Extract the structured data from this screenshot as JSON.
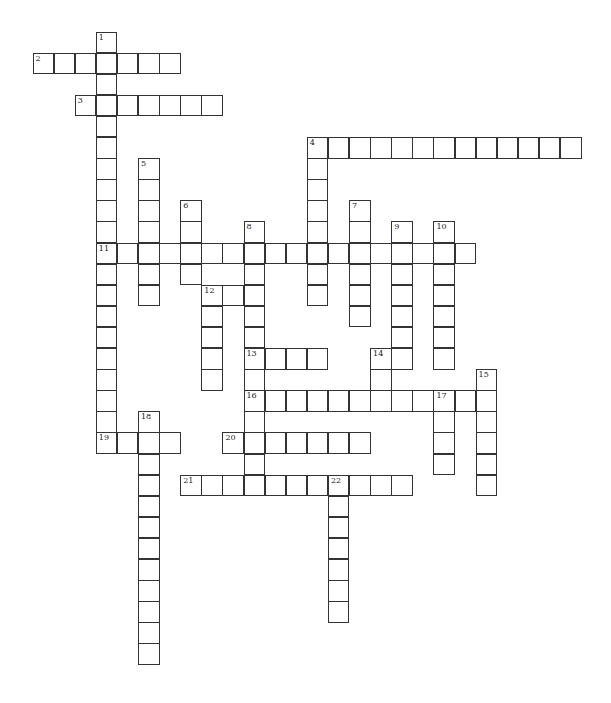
{
  "puzzle": {
    "title": "Crossword",
    "cell_size": 21.1,
    "origin_x": 33,
    "origin_y": 32,
    "entries": [
      {
        "number": "1",
        "direction": "down",
        "row": 0,
        "col": 3,
        "length": 20
      },
      {
        "number": "2",
        "direction": "across",
        "row": 1,
        "col": 0,
        "length": 7
      },
      {
        "number": "3",
        "direction": "across",
        "row": 3,
        "col": 2,
        "length": 7
      },
      {
        "number": "4",
        "direction": "across",
        "row": 5,
        "col": 13,
        "length": 13
      },
      {
        "number": "4",
        "direction": "down",
        "row": 5,
        "col": 13,
        "length": 8
      },
      {
        "number": "5",
        "direction": "down",
        "row": 6,
        "col": 5,
        "length": 7
      },
      {
        "number": "6",
        "direction": "down",
        "row": 8,
        "col": 7,
        "length": 4
      },
      {
        "number": "7",
        "direction": "down",
        "row": 8,
        "col": 15,
        "length": 6
      },
      {
        "number": "8",
        "direction": "down",
        "row": 9,
        "col": 10,
        "length": 13
      },
      {
        "number": "9",
        "direction": "down",
        "row": 9,
        "col": 17,
        "length": 7
      },
      {
        "number": "10",
        "direction": "down",
        "row": 9,
        "col": 19,
        "length": 7
      },
      {
        "number": "11",
        "direction": "across",
        "row": 10,
        "col": 3,
        "length": 18
      },
      {
        "number": "12",
        "direction": "across",
        "row": 12,
        "col": 8,
        "length": 3
      },
      {
        "number": "12",
        "direction": "down",
        "row": 12,
        "col": 8,
        "length": 5
      },
      {
        "number": "13",
        "direction": "across",
        "row": 15,
        "col": 10,
        "length": 4
      },
      {
        "number": "14",
        "direction": "down",
        "row": 15,
        "col": 16,
        "length": 3
      },
      {
        "number": "15",
        "direction": "down",
        "row": 16,
        "col": 21,
        "length": 6
      },
      {
        "number": "16",
        "direction": "across",
        "row": 17,
        "col": 10,
        "length": 12
      },
      {
        "number": "17",
        "direction": "down",
        "row": 17,
        "col": 19,
        "length": 4
      },
      {
        "number": "18",
        "direction": "down",
        "row": 18,
        "col": 5,
        "length": 12
      },
      {
        "number": "19",
        "direction": "across",
        "row": 19,
        "col": 3,
        "length": 4
      },
      {
        "number": "20",
        "direction": "across",
        "row": 19,
        "col": 9,
        "length": 7
      },
      {
        "number": "21",
        "direction": "across",
        "row": 21,
        "col": 7,
        "length": 11
      },
      {
        "number": "22",
        "direction": "down",
        "row": 21,
        "col": 14,
        "length": 7
      }
    ]
  },
  "colors": {
    "line": "#333333",
    "background": "#ffffff",
    "number": "#222222"
  }
}
